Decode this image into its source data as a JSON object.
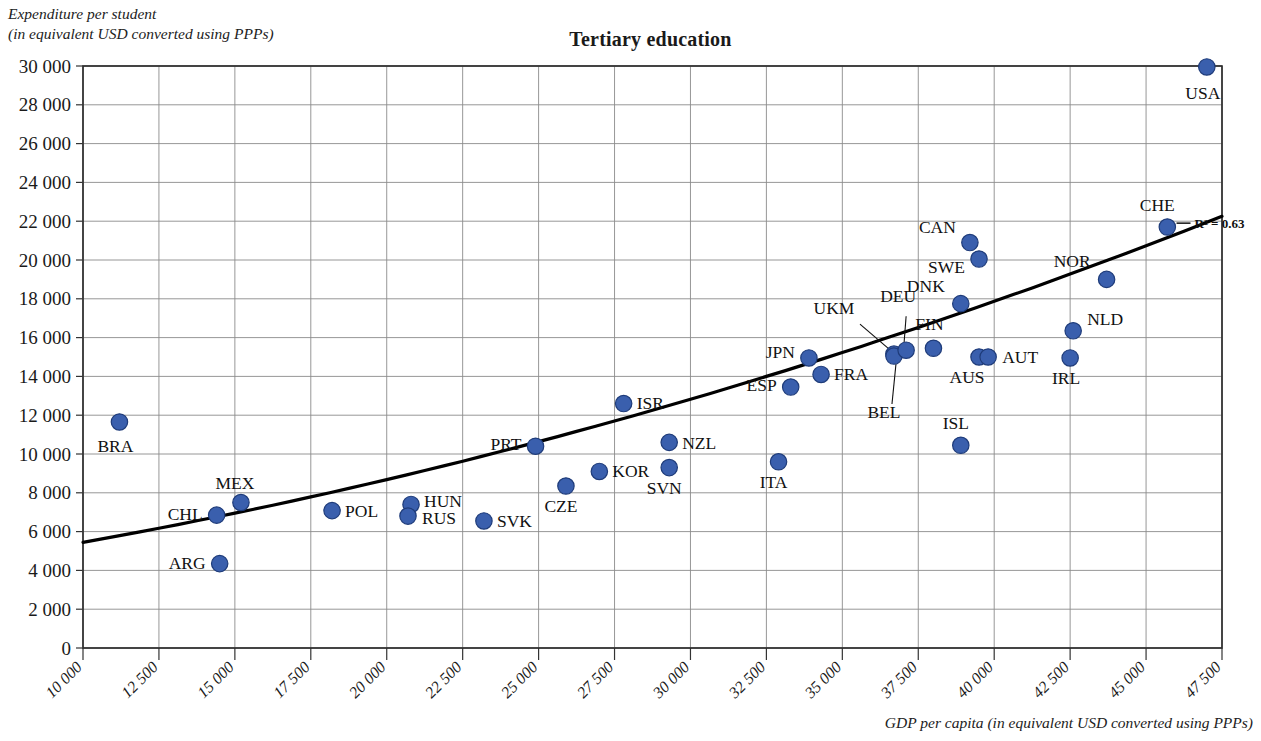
{
  "chart_data": {
    "type": "scatter",
    "title": "Tertiary education",
    "ylabel": "Expenditure per student\n(in equivalent USD converted using PPPs)",
    "ylabel_line1": "Expenditure per student",
    "ylabel_line2": "(in equivalent USD converted using PPPs)",
    "xlabel": "GDP per capita (in equivalent USD converted using PPPs)",
    "xlim": [
      10000,
      47500
    ],
    "ylim": [
      0,
      30000
    ],
    "grid": true,
    "legend": "none",
    "annotation": "R² = 0.63",
    "trendline": {
      "type": "polynomial",
      "label": "R² = 0.63",
      "x_start": 10000,
      "y_start": 5450,
      "x_end": 47500,
      "y_end": 22250
    },
    "marker_color": "#3a5fad",
    "marker_edge_color": "#1f3c7a",
    "ytick_labels": [
      "0",
      "2 000",
      "4 000",
      "6 000",
      "8 000",
      "10 000",
      "12 000",
      "14 000",
      "16 000",
      "18 000",
      "20 000",
      "22 000",
      "24 000",
      "26 000",
      "28 000",
      "30 000"
    ],
    "ytick_values": [
      0,
      2000,
      4000,
      6000,
      8000,
      10000,
      12000,
      14000,
      16000,
      18000,
      20000,
      22000,
      24000,
      26000,
      28000,
      30000
    ],
    "xtick_labels": [
      "10 000",
      "12 500",
      "15 000",
      "17 500",
      "20 000",
      "22 500",
      "25 000",
      "27 500",
      "30 000",
      "32 500",
      "35 000",
      "37 500",
      "40 000",
      "42 500",
      "45 000",
      "47 500"
    ],
    "xtick_values": [
      10000,
      12500,
      15000,
      17500,
      20000,
      22500,
      25000,
      27500,
      30000,
      32500,
      35000,
      37500,
      40000,
      42500,
      45000,
      47500
    ],
    "points": [
      {
        "label": "BRA",
        "x": 11200,
        "y": 11650,
        "lx": -22,
        "ly": 30,
        "anchor": "start"
      },
      {
        "label": "ARG",
        "x": 14500,
        "y": 4350,
        "lx": -14,
        "ly": 5,
        "anchor": "end"
      },
      {
        "label": "CHL",
        "x": 14400,
        "y": 6850,
        "lx": -14,
        "ly": 5,
        "anchor": "end"
      },
      {
        "label": "MEX",
        "x": 15200,
        "y": 7500,
        "lx": -6,
        "ly": -14,
        "anchor": "middle"
      },
      {
        "label": "POL",
        "x": 18200,
        "y": 7080,
        "lx": 13,
        "ly": 6,
        "anchor": "start"
      },
      {
        "label": "HUN",
        "x": 20800,
        "y": 7400,
        "lx": 13,
        "ly": 3,
        "anchor": "start"
      },
      {
        "label": "RUS",
        "x": 20700,
        "y": 6800,
        "lx": 14,
        "ly": 8,
        "anchor": "start"
      },
      {
        "label": "SVK",
        "x": 23200,
        "y": 6550,
        "lx": 13,
        "ly": 6,
        "anchor": "start"
      },
      {
        "label": "CZE",
        "x": 25900,
        "y": 8350,
        "lx": -5,
        "ly": 26,
        "anchor": "middle"
      },
      {
        "label": "PRT",
        "x": 24900,
        "y": 10400,
        "lx": -14,
        "ly": 4,
        "anchor": "end"
      },
      {
        "label": "KOR",
        "x": 27000,
        "y": 9100,
        "lx": 13,
        "ly": 6,
        "anchor": "start"
      },
      {
        "label": "ISR",
        "x": 27800,
        "y": 12600,
        "lx": 13,
        "ly": 5,
        "anchor": "start"
      },
      {
        "label": "NZL",
        "x": 29300,
        "y": 10600,
        "lx": 13,
        "ly": 7,
        "anchor": "start"
      },
      {
        "label": "SVN",
        "x": 29300,
        "y": 9300,
        "lx": -5,
        "ly": 26,
        "anchor": "middle"
      },
      {
        "label": "ITA",
        "x": 32900,
        "y": 9600,
        "lx": -5,
        "ly": 26,
        "anchor": "middle"
      },
      {
        "label": "ESP",
        "x": 33300,
        "y": 13450,
        "lx": -14,
        "ly": 4,
        "anchor": "end"
      },
      {
        "label": "JPN",
        "x": 33900,
        "y": 14950,
        "lx": -14,
        "ly": 0,
        "anchor": "end"
      },
      {
        "label": "FRA",
        "x": 34300,
        "y": 14100,
        "lx": 13,
        "ly": 6,
        "anchor": "start"
      },
      {
        "label": "UKM",
        "x": 36700,
        "y": 15150,
        "lx": -60,
        "ly": -40,
        "anchor": "middle",
        "leader": true
      },
      {
        "label": "BEL",
        "x": 36700,
        "y": 15050,
        "lx": -10,
        "ly": 62,
        "anchor": "middle",
        "leader": true
      },
      {
        "label": "DEU",
        "x": 37100,
        "y": 15350,
        "lx": -8,
        "ly": -48,
        "anchor": "middle",
        "leader": true
      },
      {
        "label": "FIN",
        "x": 38000,
        "y": 15450,
        "lx": -4,
        "ly": -18,
        "anchor": "middle"
      },
      {
        "label": "DNK",
        "x": 38900,
        "y": 17750,
        "lx": -16,
        "ly": -12,
        "anchor": "end"
      },
      {
        "label": "ISL",
        "x": 38900,
        "y": 10450,
        "lx": -5,
        "ly": -16,
        "anchor": "middle"
      },
      {
        "label": "AUS",
        "x": 39500,
        "y": 15000,
        "lx": -12,
        "ly": 26,
        "anchor": "middle"
      },
      {
        "label": "AUT",
        "x": 39800,
        "y": 15000,
        "lx": 14,
        "ly": 6,
        "anchor": "start"
      },
      {
        "label": "CAN",
        "x": 39200,
        "y": 20900,
        "lx": -14,
        "ly": -10,
        "anchor": "end"
      },
      {
        "label": "SWE",
        "x": 39500,
        "y": 20050,
        "lx": -14,
        "ly": 14,
        "anchor": "end"
      },
      {
        "label": "NLD",
        "x": 42600,
        "y": 16350,
        "lx": 14,
        "ly": -6,
        "anchor": "start"
      },
      {
        "label": "IRL",
        "x": 42500,
        "y": 14950,
        "lx": -4,
        "ly": 26,
        "anchor": "middle"
      },
      {
        "label": "NOR",
        "x": 43700,
        "y": 19000,
        "lx": -16,
        "ly": -12,
        "anchor": "end"
      },
      {
        "label": "CHE",
        "x": 45700,
        "y": 21700,
        "lx": -10,
        "ly": -16,
        "anchor": "middle"
      },
      {
        "label": "USA",
        "x": 47000,
        "y": 29950,
        "lx": -4,
        "ly": 32,
        "anchor": "middle"
      }
    ]
  }
}
